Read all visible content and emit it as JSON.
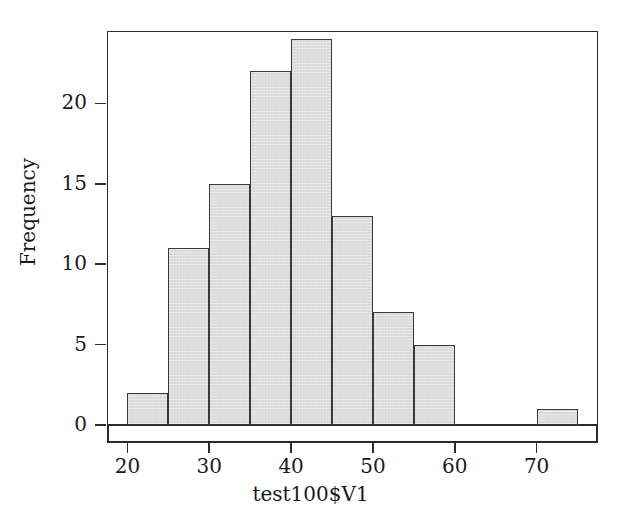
{
  "chart_data": {
    "type": "bar",
    "chart_kind": "histogram",
    "title": "",
    "subtitle": "",
    "xlabel": "test100$V1",
    "ylabel": "Frequency",
    "xlim": [
      17.5,
      77.5
    ],
    "ylim": [
      0,
      24.5
    ],
    "grid": false,
    "legend": null,
    "bin_width": 5,
    "bin_edges": [
      20,
      25,
      30,
      35,
      40,
      45,
      50,
      55,
      60,
      65,
      70,
      75
    ],
    "categories": [
      "20-25",
      "25-30",
      "30-35",
      "35-40",
      "40-45",
      "45-50",
      "50-55",
      "55-60",
      "60-65",
      "65-70",
      "70-75"
    ],
    "values": [
      2,
      11,
      15,
      22,
      24,
      13,
      7,
      5,
      0,
      0,
      1
    ],
    "x_tick_labels": [
      "20",
      "30",
      "40",
      "50",
      "60",
      "70"
    ],
    "x_tick_values": [
      20,
      30,
      40,
      50,
      60,
      70
    ],
    "y_tick_labels": [
      "0",
      "5",
      "10",
      "15",
      "20"
    ],
    "y_tick_values": [
      0,
      5,
      10,
      15,
      20
    ],
    "total_count": 100,
    "bar_fill_color": "#dedede",
    "bar_border_color": "#3a3a3a",
    "axis_color": "#2b2b2b",
    "background_color": "#ffffff",
    "bars": [
      {
        "label": "20-25",
        "x0": 20,
        "x1": 25,
        "value": 2
      },
      {
        "label": "25-30",
        "x0": 25,
        "x1": 30,
        "value": 11
      },
      {
        "label": "30-35",
        "x0": 30,
        "x1": 35,
        "value": 15
      },
      {
        "label": "35-40",
        "x0": 35,
        "x1": 40,
        "value": 22
      },
      {
        "label": "40-45",
        "x0": 40,
        "x1": 45,
        "value": 24
      },
      {
        "label": "45-50",
        "x0": 45,
        "x1": 50,
        "value": 13
      },
      {
        "label": "50-55",
        "x0": 50,
        "x1": 55,
        "value": 7
      },
      {
        "label": "55-60",
        "x0": 55,
        "x1": 60,
        "value": 5
      },
      {
        "label": "60-65",
        "x0": 60,
        "x1": 65,
        "value": 0
      },
      {
        "label": "65-70",
        "x0": 65,
        "x1": 70,
        "value": 0
      },
      {
        "label": "70-75",
        "x0": 70,
        "x1": 75,
        "value": 1
      }
    ]
  }
}
